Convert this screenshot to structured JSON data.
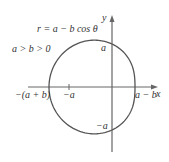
{
  "title": "r = a − b cos θ",
  "condition": "a > b > 0",
  "axes": {
    "x_label": "x",
    "y_label": "y"
  },
  "labels": {
    "left_intercept": "−(a + b)",
    "neg_a_tick": "−a",
    "right_intercept": "a − b",
    "top_intercept": "a",
    "bottom_intercept": "−a"
  },
  "colors": {
    "curve": "#555555",
    "axis": "#666666",
    "text": "#333333"
  },
  "chart_data": {
    "type": "polar-curve",
    "equation": "r = a - b cos(theta)",
    "condition": "a > b > 0",
    "params": {
      "a": 43,
      "b": 20
    },
    "intercepts": {
      "x": [
        "-(a+b)",
        "a-b"
      ],
      "y": [
        "a",
        "-a"
      ]
    },
    "tick_marks": [
      "-a"
    ],
    "origin_px": [
      112,
      87
    ]
  }
}
